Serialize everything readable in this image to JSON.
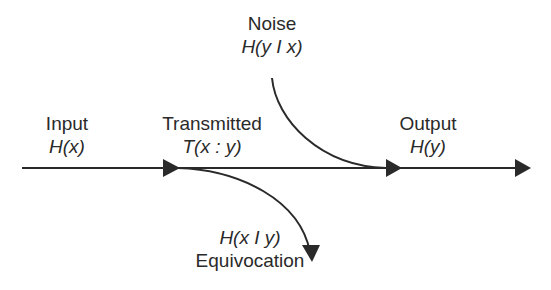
{
  "diagram": {
    "type": "information-flow",
    "colors": {
      "line": "#2a2a2a",
      "background": "#ffffff"
    },
    "nodes": {
      "input": {
        "title": "Input",
        "formula": "H(x)"
      },
      "transmitted": {
        "title": "Transmitted",
        "formula": "T(x : y)"
      },
      "noise": {
        "title": "Noise",
        "formula": "H(y I x)"
      },
      "output": {
        "title": "Output",
        "formula": "H(y)"
      },
      "equivocation": {
        "title": "Equivocation",
        "formula": "H(x I y)"
      }
    },
    "edges": [
      {
        "from": "input",
        "to": "transmitted",
        "kind": "straight-arrow"
      },
      {
        "from": "transmitted",
        "to": "output",
        "kind": "straight-arrow"
      },
      {
        "from": "noise",
        "to": "main-line",
        "kind": "curved-arrow-merge"
      },
      {
        "from": "transmitted",
        "to": "equivocation",
        "kind": "curved-arrow-branch"
      }
    ]
  }
}
